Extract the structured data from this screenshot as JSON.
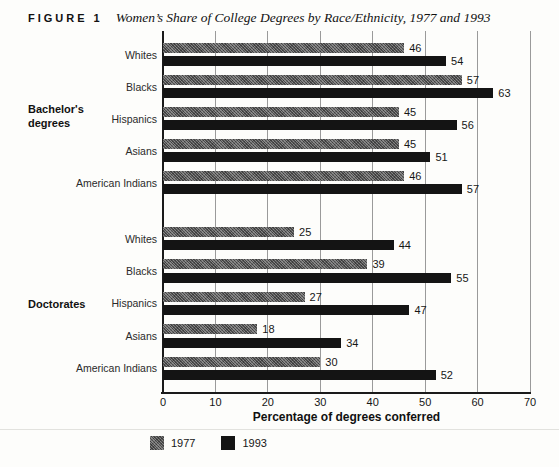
{
  "figure": {
    "label": "FIGURE 1",
    "title": "Women’s Share of College Degrees by Race/Ethnicity, 1977 and 1993"
  },
  "chart_data": {
    "type": "bar",
    "orientation": "horizontal",
    "title": "Women’s Share of College Degrees by Race/Ethnicity, 1977 and 1993",
    "xlabel": "Percentage of degrees conferred",
    "xlim": [
      0,
      70
    ],
    "xticks": [
      0,
      10,
      20,
      30,
      40,
      50,
      60,
      70
    ],
    "grid": "vertical-gridlines-on",
    "legend_position": "bottom",
    "groups": [
      {
        "section": "Bachelor's degrees",
        "categories": [
          "Whites",
          "Blacks",
          "Hispanics",
          "Asians",
          "American Indians"
        ],
        "series": [
          {
            "name": "1977",
            "values": [
              46,
              57,
              45,
              45,
              46
            ]
          },
          {
            "name": "1993",
            "values": [
              54,
              63,
              56,
              51,
              57
            ]
          }
        ]
      },
      {
        "section": "Doctorates",
        "categories": [
          "Whites",
          "Blacks",
          "Hispanics",
          "Asians",
          "American Indians"
        ],
        "series": [
          {
            "name": "1977",
            "values": [
              25,
              39,
              27,
              18,
              30
            ]
          },
          {
            "name": "1993",
            "values": [
              44,
              55,
              47,
              34,
              52
            ]
          }
        ]
      }
    ],
    "legend": [
      {
        "label": "1977",
        "color": "#6f6f6f"
      },
      {
        "label": "1993",
        "color": "#141414"
      }
    ],
    "colors": {
      "bar_1977": "#6f6f6f",
      "bar_1993": "#141414",
      "gridline": "#9a9a9a",
      "axis": "#1a1a1a"
    }
  }
}
